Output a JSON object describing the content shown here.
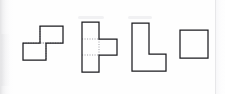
{
  "sheet": {
    "background_color": "#fefefe",
    "stroke_color": "#1b1b1f",
    "guide_color": "#9a9aa0",
    "width": 225,
    "height": 94
  },
  "figures": [
    {
      "id": "figure-1",
      "name": "s-shape",
      "label": "S-shaped figure of two offset rectangles",
      "cell_size": 17,
      "has_guides": true,
      "outline": "M 17,0 L 40,0 L 40,17 L 23,17 L 23,34 L 0,34 L 0,17 L 17,17 Z",
      "guides": [
        "M 17,0 L 17,17",
        "M 23,17 L 23,34",
        "M 0,17 L 23,17",
        "M 17,17 L 40,17"
      ],
      "x": 21,
      "y": 24,
      "width": 40,
      "height": 34
    },
    {
      "id": "figure-2",
      "name": "t-shape",
      "label": "T-shaped figure, three stacked cells with right tab",
      "cell_size": 17,
      "has_guides": true,
      "outline": "M 0,0 L 17,0 L 17,17 L 35,17 L 35,33 L 17,33 L 17,50 L 0,50 Z",
      "guides": [
        "M 0,17 L 17,17",
        "M 0,33 L 17,33",
        "M 17,17 L 17,33"
      ],
      "x": 80,
      "y": 20,
      "width": 35,
      "height": 50
    },
    {
      "id": "figure-3",
      "name": "l-shape",
      "label": "L-shaped figure outline",
      "cell_size": 17,
      "has_guides": false,
      "outline": "M 0,0 L 17,0 L 17,31 L 34,31 L 34,48 L 0,48 Z",
      "guides": [],
      "x": 130,
      "y": 21,
      "width": 34,
      "height": 48
    },
    {
      "id": "figure-4",
      "name": "square-shape",
      "label": "Square outline",
      "cell_size": 28,
      "has_guides": false,
      "outline": "M 0,0 L 28,0 L 28,28 L 0,28 Z",
      "guides": [],
      "x": 178,
      "y": 28,
      "width": 28,
      "height": 28
    }
  ],
  "artifacts": {
    "left_band_label": "scan-edge-shadow",
    "right_rule_label": "page-edge-line",
    "top_smudges": [
      {
        "x": 78,
        "y": 16,
        "width": 26
      },
      {
        "x": 128,
        "y": 16,
        "width": 24
      }
    ]
  }
}
